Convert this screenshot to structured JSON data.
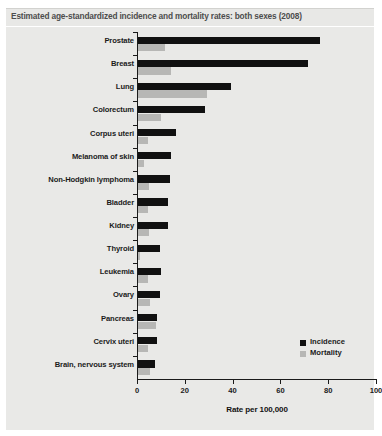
{
  "header": {
    "title": "Estimated age-standardized incidence and mortality rates: both sexes (2008)"
  },
  "legend": {
    "position": "bottom-right",
    "items": [
      {
        "label": "Incidence",
        "color": "#111111"
      },
      {
        "label": "Mortality",
        "color": "#b7b7b5"
      }
    ]
  },
  "chart_data": {
    "type": "bar",
    "orientation": "horizontal",
    "title": "Estimated age-standardized incidence and mortality rates: both sexes (2008)",
    "xlabel": "Rate per 100,000",
    "ylabel": "",
    "xlim": [
      0,
      100
    ],
    "xticks": [
      0,
      20,
      40,
      60,
      80,
      100
    ],
    "grid": false,
    "categories": [
      "Prostate",
      "Breast",
      "Lung",
      "Colorectum",
      "Corpus uteri",
      "Melanoma of skin",
      "Non-Hodgkin lymphoma",
      "Bladder",
      "Kidney",
      "Thyroid",
      "Leukemia",
      "Ovary",
      "Pancreas",
      "Cervix uteri",
      "Brain, nervous system"
    ],
    "series": [
      {
        "name": "Incidence",
        "color": "#111111",
        "values": [
          76.0,
          71.0,
          39.0,
          28.0,
          16.0,
          14.0,
          13.5,
          12.5,
          12.5,
          9.0,
          9.5,
          9.0,
          8.0,
          8.0,
          7.0
        ]
      },
      {
        "name": "Mortality",
        "color": "#b7b7b5",
        "values": [
          11.5,
          14.0,
          29.0,
          9.5,
          4.0,
          2.5,
          4.5,
          4.0,
          4.5,
          0.9,
          4.0,
          5.0,
          7.5,
          4.0,
          5.0
        ]
      }
    ]
  }
}
